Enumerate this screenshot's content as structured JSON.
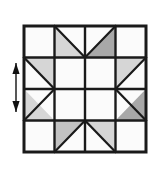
{
  "figure": {
    "background_color": "#ffffff"
  },
  "chart_data": {
    "type": "heatmap",
    "xlabel": "",
    "ylabel": "",
    "grid": true,
    "rows": 4,
    "cols": 4,
    "categories": [
      "col1",
      "col2",
      "col3",
      "col4"
    ],
    "row_labels": [
      "row1",
      "row2",
      "row3",
      "row4"
    ],
    "legend_position": "none",
    "cell_shading": {
      "white": "#fbfbfb",
      "light_gray": "#d6d6d6",
      "mid_gray": "#c2c2c2",
      "dark_gray": "#a8a8a8"
    },
    "cells": [
      {
        "row": 1,
        "col": 1,
        "fill": "white",
        "diagonal": "none",
        "shaded_half": "none",
        "shade": "none"
      },
      {
        "row": 1,
        "col": 2,
        "fill": "half",
        "diagonal": "tl-br",
        "shaded_half": "lower-left",
        "shade": "light_gray"
      },
      {
        "row": 1,
        "col": 3,
        "fill": "half",
        "diagonal": "bl-tr",
        "shaded_half": "lower-right",
        "shade": "dark_gray"
      },
      {
        "row": 1,
        "col": 4,
        "fill": "white",
        "diagonal": "none",
        "shaded_half": "none",
        "shade": "none"
      },
      {
        "row": 2,
        "col": 1,
        "fill": "half",
        "diagonal": "tl-br",
        "shaded_half": "upper-right",
        "shade": "light_gray"
      },
      {
        "row": 2,
        "col": 2,
        "fill": "white",
        "diagonal": "none",
        "shaded_half": "none",
        "shade": "none"
      },
      {
        "row": 2,
        "col": 3,
        "fill": "white",
        "diagonal": "none",
        "shaded_half": "none",
        "shade": "none"
      },
      {
        "row": 2,
        "col": 4,
        "fill": "half",
        "diagonal": "bl-tr",
        "shaded_half": "upper-left",
        "shade": "light_gray"
      },
      {
        "row": 3,
        "col": 1,
        "fill": "half",
        "diagonal": "bl-tr",
        "shaded_half": "lower-left",
        "shade": "light_gray"
      },
      {
        "row": 3,
        "col": 2,
        "fill": "white",
        "diagonal": "none",
        "shaded_half": "none",
        "shade": "none"
      },
      {
        "row": 3,
        "col": 3,
        "fill": "white",
        "diagonal": "none",
        "shaded_half": "none",
        "shade": "none"
      },
      {
        "row": 3,
        "col": 4,
        "fill": "half",
        "diagonal": "tl-br",
        "shaded_half": "lower-right",
        "shade": "dark_gray"
      },
      {
        "row": 4,
        "col": 1,
        "fill": "white",
        "diagonal": "none",
        "shaded_half": "none",
        "shade": "none"
      },
      {
        "row": 4,
        "col": 2,
        "fill": "half",
        "diagonal": "bl-tr",
        "shaded_half": "upper-left",
        "shade": "mid_gray"
      },
      {
        "row": 4,
        "col": 3,
        "fill": "half",
        "diagonal": "tl-br",
        "shaded_half": "upper-right",
        "shade": "light_gray"
      },
      {
        "row": 4,
        "col": 4,
        "fill": "white",
        "diagonal": "none",
        "shaded_half": "none",
        "shade": "none"
      }
    ],
    "annotations": [
      {
        "name": "vertical-double-arrow",
        "kind": "double-headed-arrow",
        "orientation": "vertical",
        "label": "",
        "x": 16,
        "y_top": 63,
        "y_bottom": 112,
        "color": "#111111"
      }
    ],
    "geometry": {
      "grid_left": 24,
      "grid_top": 26,
      "grid_right": 146,
      "grid_bottom": 152,
      "outer_border_width": 3,
      "inner_line_width": 2.4,
      "diagonal_line_width": 2.2,
      "line_color": "#1a1a1a"
    }
  }
}
